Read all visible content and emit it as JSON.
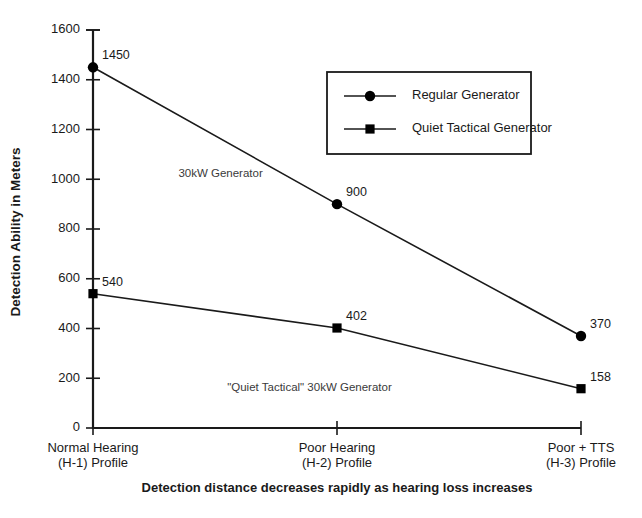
{
  "chart_data": {
    "type": "line",
    "title": "",
    "xlabel": "Detection distance decreases rapidly as hearing loss increases",
    "ylabel": "Detection Ability in Meters",
    "ylim": [
      0,
      1600
    ],
    "yticks": [
      0,
      200,
      400,
      600,
      800,
      1000,
      1200,
      1400,
      1600
    ],
    "ytick_labels": [
      "0",
      "200",
      "400",
      "600",
      "800",
      "1000",
      "1200",
      "1400",
      "1600"
    ],
    "grid": false,
    "legend_position": "upper right",
    "categories": [
      "Normal Hearing (H-1) Profile",
      "Poor Hearing (H-2) Profile",
      "Poor + TTS (H-3) Profile"
    ],
    "category_lines": [
      [
        "Normal Hearing",
        "(H-1) Profile"
      ],
      [
        "Poor Hearing",
        "(H-2) Profile"
      ],
      [
        "Poor + TTS",
        "(H-3) Profile"
      ]
    ],
    "series": [
      {
        "name": "Regular Generator",
        "marker": "circle",
        "values": [
          1450,
          900,
          370
        ],
        "value_labels": [
          "1450",
          "900",
          "370"
        ]
      },
      {
        "name": "Quiet Tactical Generator",
        "marker": "square",
        "values": [
          540,
          402,
          158
        ],
        "value_labels": [
          "540",
          "402",
          "158"
        ]
      }
    ],
    "annotations": [
      {
        "text": "30kW Generator",
        "x_index": 0.35,
        "y_value": 1010
      },
      {
        "text": "\"Quiet Tactical\" 30kW Generator",
        "x_index": 0.55,
        "y_value": 150
      }
    ],
    "colors": {
      "line": "#1a1a1a",
      "marker": "#000000",
      "text": "#1a1a1a",
      "background": "#ffffff"
    }
  },
  "legend": {
    "entries": [
      {
        "label": "Regular Generator",
        "marker": "circle"
      },
      {
        "label": "Quiet Tactical Generator",
        "marker": "square"
      }
    ]
  },
  "caption": {
    "text": "Detection distance decreases rapidly as hearing loss increases"
  },
  "axes": {
    "y_title": "Detection Ability in Meters"
  }
}
